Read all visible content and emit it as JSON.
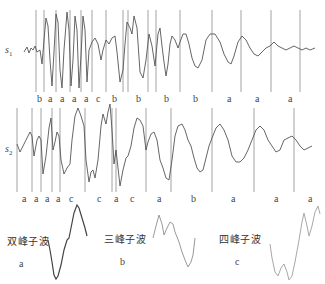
{
  "signals": [
    {
      "id": "s1",
      "label": "s",
      "subscript": "1",
      "segment_labels": [
        "b",
        "a",
        "a",
        "a",
        "a",
        "c",
        "b",
        "b",
        "b",
        "b",
        "a",
        "a",
        "a"
      ]
    },
    {
      "id": "s2",
      "label": "s",
      "subscript": "2",
      "segment_labels": [
        "a",
        "a",
        "a",
        "a",
        "c",
        "c",
        "a",
        "c",
        "a",
        "b",
        "a",
        "a",
        "a"
      ]
    }
  ],
  "subwaves": [
    {
      "title": "双峰子波",
      "letter": "a",
      "color": "#444444"
    },
    {
      "title": "三峰子波",
      "letter": "b",
      "color": "#9a9a9a"
    },
    {
      "title": "四峰子波",
      "letter": "c",
      "color": "#a8a8a8"
    }
  ],
  "colors": {
    "waveform": "#555555",
    "divider": "#8a8a8a"
  }
}
